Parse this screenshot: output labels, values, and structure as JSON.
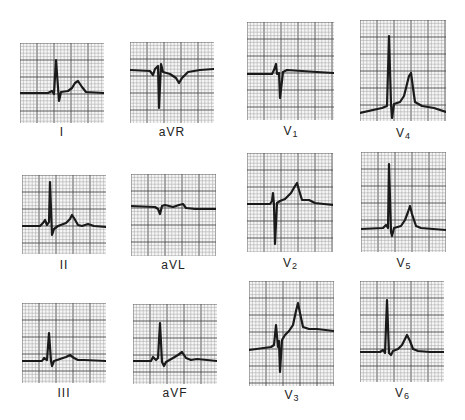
{
  "figure": {
    "grid": {
      "minor_px": 3.4,
      "major_every": 5,
      "minor_color": "#9a9a9a",
      "major_color": "#4a4a4a",
      "trace_color": "#1a1a1a"
    },
    "leads": [
      {
        "id": "I",
        "label": "I",
        "sub": "",
        "box": [
          20,
          43,
          84,
          80
        ],
        "label_y": 125,
        "trace": "M0 50 L28 50 L32 48 L34 51 L36 17 L39 58 L41 49 L48 48 L52 45 L55 40 L58 38 L62 44 L66 49 L84 50"
      },
      {
        "id": "aVR",
        "label": "aVR",
        "sub": "",
        "box": [
          130,
          42,
          84,
          81
        ],
        "label_y": 125,
        "trace": "M0 28 L20 29 L23 33 L25 27 L28 24 L29 66 L31 22 L33 30 L40 32 L46 36 L49 41 L52 36 L58 30 L70 28 L84 27"
      },
      {
        "id": "V1",
        "label": "V",
        "sub": "1",
        "box": [
          247,
          22,
          87,
          98
        ],
        "label_y": 124,
        "trace": "M0 52 L25 52 L27 48 L29 42 L30 52 L32 51 L33 76 L36 50 L40 48 L55 49 L70 50 L87 51"
      },
      {
        "id": "V4",
        "label": "V",
        "sub": "4",
        "box": [
          360,
          20,
          86,
          101
        ],
        "label_y": 126,
        "trace": "M0 93 L22 88 L27 86 L29 16 L31 84 L32 98 L34 84 L40 82 L44 76 L47 64 L49 56 L51 53 L53 68 L55 82 L62 86 L74 88 L86 92"
      },
      {
        "id": "II",
        "label": "I",
        "sub": "I_",
        "box": [
          22,
          175,
          84,
          79
        ],
        "label_y": 258,
        "trace": "M0 51 L18 51 L21 48 L23 45 L25 50 L27 47 L28 7 L30 60 L32 54 L36 51 L44 48 L48 44 L50 40 L52 43 L56 50 L60 51 L66 49 L72 51 L84 52"
      },
      {
        "id": "aVL",
        "label": "aVL",
        "sub": "",
        "box": [
          131,
          174,
          85,
          82
        ],
        "label_y": 258,
        "trace": "M0 32 L24 33 L27 35 L29 40 L31 32 L34 31 L42 33 L48 31 L52 30 L55 34 L64 35 L85 35"
      },
      {
        "id": "V2",
        "label": "V",
        "sub": "2",
        "box": [
          247,
          153,
          86,
          99
        ],
        "label_y": 256,
        "trace": "M0 51 L23 51 L25 48 L26 40 L27 52 L28 91 L30 50 L33 48 L38 46 L44 40 L48 33 L50 30 L52 37 L55 47 L62 47 L68 50 L86 52"
      },
      {
        "id": "V5",
        "label": "V",
        "sub": "5",
        "box": [
          361,
          152,
          85,
          100
        ],
        "label_y": 256,
        "trace": "M0 77 L22 76 L25 73 L27 76 L28 12 L30 80 L31 84 L33 76 L40 74 L44 68 L47 60 L49 54 L51 62 L55 74 L60 76 L72 77 L85 78"
      },
      {
        "id": "III",
        "label": "III",
        "sub": "",
        "box": [
          22,
          303,
          84,
          80
        ],
        "label_y": 386,
        "trace": "M0 58 L20 58 L22 55 L25 57 L27 30 L29 58 L30 63 L32 58 L38 56 L44 54 L48 52 L52 55 L56 57 L62 57 L84 58"
      },
      {
        "id": "aVF",
        "label": "aVF",
        "sub": "",
        "box": [
          133,
          304,
          84,
          80
        ],
        "label_y": 386,
        "trace": "M0 57 L18 57 L20 53 L23 56 L25 54 L27 19 L29 58 L31 62 L33 58 L40 54 L45 51 L49 48 L53 54 L58 56 L64 55 L84 57"
      },
      {
        "id": "V3",
        "label": "V",
        "sub": "3",
        "box": [
          249,
          281,
          85,
          105
        ],
        "label_y": 388,
        "trace": "M0 69 L22 66 L25 64 L27 44 L29 66 L30 60 L31 91 L33 59 L36 54 L40 50 L44 44 L47 30 L49 22 L51 32 L54 46 L60 48 L68 48 L85 50"
      },
      {
        "id": "V6",
        "label": "V",
        "sub": "6",
        "box": [
          360,
          281,
          84,
          101
        ],
        "label_y": 386,
        "trace": "M0 71 L20 71 L23 69 L25 72 L27 19 L29 72 L31 74 L33 70 L38 68 L42 64 L45 58 L47 54 L50 60 L53 68 L58 70 L70 71 L84 71"
      }
    ]
  }
}
